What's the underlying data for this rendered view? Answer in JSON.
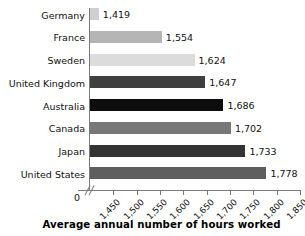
{
  "chart_data": {
    "type": "bar",
    "orientation": "horizontal",
    "title": "",
    "xlabel": "Average annual number of hours worked",
    "ylabel": "",
    "categories": [
      "Germany",
      "France",
      "Sweden",
      "United Kingdom",
      "Australia",
      "Canada",
      "Japan",
      "United States"
    ],
    "values": [
      1419,
      1554,
      1624,
      1647,
      1686,
      1702,
      1733,
      1778
    ],
    "value_labels": [
      "1,419",
      "1,554",
      "1,624",
      "1,647",
      "1,686",
      "1,702",
      "1,733",
      "1,778"
    ],
    "bar_colors": [
      "#cfcfcf",
      "#b5b5b5",
      "#dcdcdc",
      "#3f3f3f",
      "#0d0d0d",
      "#787878",
      "#343434",
      "#5e5e5e"
    ],
    "xlim": [
      1400,
      1850
    ],
    "xticks": [
      1450,
      1500,
      1550,
      1600,
      1650,
      1700,
      1750,
      1800,
      1850
    ],
    "xtick_labels": [
      "1,450",
      "1,500",
      "1,550",
      "1,600",
      "1,650",
      "1,700",
      "1,750",
      "1,800",
      "1,850"
    ],
    "origin_label": "0",
    "axis_break": true,
    "grid": false,
    "legend": null
  },
  "axis": {
    "line_color": "#7a7a7a"
  }
}
